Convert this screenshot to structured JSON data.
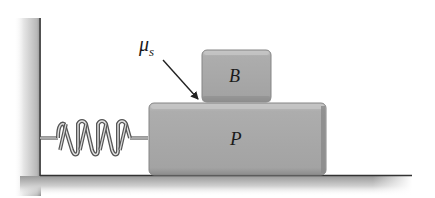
{
  "diagram": {
    "type": "physics-mechanics",
    "labels": {
      "friction_coefficient": "μ",
      "friction_subscript": "s",
      "upper_block": "B",
      "lower_block": "P"
    },
    "components": [
      {
        "id": "wall",
        "kind": "fixed-support"
      },
      {
        "id": "spring",
        "kind": "spring",
        "coils": 6
      },
      {
        "id": "block-P",
        "kind": "block",
        "label": "P"
      },
      {
        "id": "block-B",
        "kind": "block",
        "label": "B"
      },
      {
        "id": "floor",
        "kind": "surface"
      },
      {
        "id": "mu-arrow",
        "kind": "pointer",
        "points_to": "B-P contact surface"
      }
    ],
    "colors": {
      "block_fill": "#a9a9a9",
      "block_edge": "#7a7a7a",
      "block_highlight": "#c4c4c4",
      "wall_dark": "#4a4a4a",
      "wall_light": "#e8e8e8",
      "spring_dark": "#555555",
      "spring_light": "#e0e0e0",
      "arrow": "#222222"
    }
  }
}
